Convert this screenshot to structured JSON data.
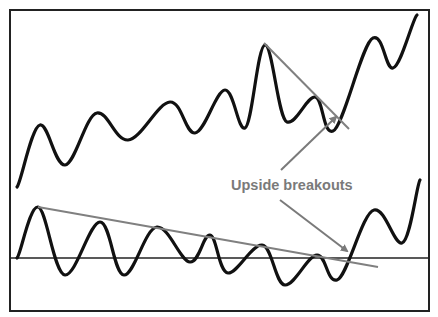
{
  "diagram": {
    "type": "technical-analysis-illustration",
    "annotation": {
      "label": "Upside breakouts",
      "position": [
        231,
        190
      ],
      "color": "#7a7a7a"
    },
    "frame": {
      "x": 10,
      "y": 10,
      "width": 419,
      "height": 301,
      "color": "#222222"
    },
    "colors": {
      "price_line": "#111111",
      "trendline": "#808080",
      "arrow": "#7a7a7a",
      "baseline": "#222222"
    },
    "price_series": {
      "name": "price",
      "points": [
        [
          17,
          187
        ],
        [
          40,
          125
        ],
        [
          65,
          165
        ],
        [
          97,
          113
        ],
        [
          128,
          140
        ],
        [
          170,
          102
        ],
        [
          195,
          133
        ],
        [
          225,
          90
        ],
        [
          245,
          128
        ],
        [
          265,
          45
        ],
        [
          287,
          122
        ],
        [
          315,
          97
        ],
        [
          333,
          131
        ],
        [
          373,
          38
        ],
        [
          393,
          68
        ],
        [
          417,
          15
        ]
      ]
    },
    "price_trendline": {
      "from": [
        264,
        43
      ],
      "to": [
        349,
        129
      ]
    },
    "oscillator_series": {
      "name": "oscillator",
      "baseline_y": 258,
      "points": [
        [
          17,
          258
        ],
        [
          38,
          207
        ],
        [
          65,
          275
        ],
        [
          100,
          222
        ],
        [
          124,
          275
        ],
        [
          157,
          227
        ],
        [
          190,
          262
        ],
        [
          210,
          235
        ],
        [
          228,
          273
        ],
        [
          262,
          245
        ],
        [
          285,
          285
        ],
        [
          317,
          255
        ],
        [
          337,
          280
        ],
        [
          374,
          210
        ],
        [
          402,
          243
        ],
        [
          420,
          180
        ]
      ]
    },
    "oscillator_trendline": {
      "from": [
        38,
        207
      ],
      "to": [
        378,
        267
      ]
    },
    "arrows": [
      {
        "name": "arrow-to-price-breakout",
        "from": [
          281,
          170
        ],
        "to": [
          336,
          117
        ]
      },
      {
        "name": "arrow-to-oscillator-breakout",
        "from": [
          280,
          200
        ],
        "to": [
          347,
          251
        ]
      }
    ]
  }
}
